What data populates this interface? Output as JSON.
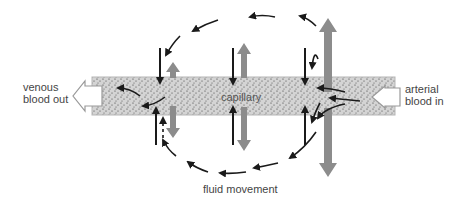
{
  "diagram": {
    "labels": {
      "venous": [
        "venous",
        "blood out"
      ],
      "arterial": [
        "arterial",
        "blood in"
      ],
      "capillary": "capillary",
      "fluid_movement": "fluid movement"
    },
    "colors": {
      "capillary_fill": "#d2d2d2",
      "gray_arrow": "#8c8c8c",
      "black_arrow": "#1a1a1a",
      "text": "#444444"
    }
  }
}
